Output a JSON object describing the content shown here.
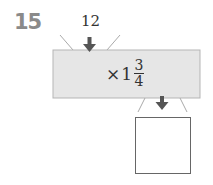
{
  "question_number": "15",
  "machine": {
    "input_value": "12",
    "operation": {
      "symbol": "×",
      "whole": "1",
      "numerator": "3",
      "denominator": "4"
    },
    "output_value": "",
    "colors": {
      "box_fill": "#e6e6e6",
      "box_border": "#b5b5b5",
      "arrow": "#555555"
    }
  }
}
